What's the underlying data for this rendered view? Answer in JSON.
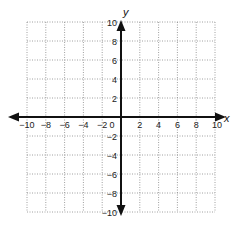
{
  "chart_data": {
    "type": "scatter",
    "title": "",
    "xlabel": "x",
    "ylabel": "y",
    "xlim": [
      -10,
      10
    ],
    "ylim": [
      -10,
      10
    ],
    "grid": true,
    "grid_step": 2,
    "grid_style": "dotted",
    "x_ticks": [
      -10,
      -8,
      -6,
      -4,
      -2,
      2,
      4,
      6,
      8,
      10
    ],
    "y_ticks": [
      10,
      8,
      6,
      4,
      2,
      -2,
      -4,
      -6,
      -8,
      -10
    ],
    "x_tick_labels": [
      "−10",
      "−8",
      "−6",
      "−4",
      "−2",
      "2",
      "4",
      "6",
      "8",
      "10"
    ],
    "y_tick_labels": [
      "10",
      "8",
      "6",
      "4",
      "2",
      "−2",
      "−4",
      "−6",
      "−8",
      "−10"
    ],
    "origin_label": "0",
    "series": [],
    "legend": null
  },
  "colors": {
    "axis": "#111111",
    "grid": "#888888",
    "background": "#ffffff"
  }
}
